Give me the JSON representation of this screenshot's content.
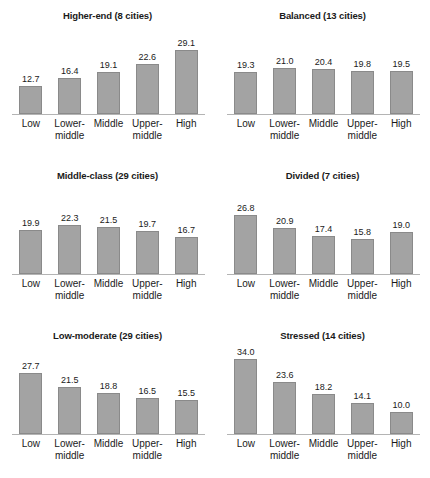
{
  "chart_data": {
    "type": "bar",
    "title": "",
    "xlabel": "",
    "ylabel": "",
    "ylim": [
      0,
      36
    ],
    "grid": false,
    "legend": "none",
    "categories": [
      "Low",
      "Lower-middle",
      "Middle",
      "Upper-middle",
      "High"
    ],
    "category_lines": [
      [
        "Low",
        ""
      ],
      [
        "Lower-",
        "middle"
      ],
      [
        "Middle",
        ""
      ],
      [
        "Upper-",
        "middle"
      ],
      [
        "High",
        ""
      ]
    ],
    "panels": [
      {
        "title": "Higher-end (8 cities)",
        "name": "Higher-end",
        "cities": 8,
        "values": [
          12.7,
          16.4,
          19.1,
          22.6,
          29.1
        ],
        "labels": [
          "12.7",
          "16.4",
          "19.1",
          "22.6",
          "29.1"
        ]
      },
      {
        "title": "Balanced (13 cities)",
        "name": "Balanced",
        "cities": 13,
        "values": [
          19.3,
          21.0,
          20.4,
          19.8,
          19.5
        ],
        "labels": [
          "19.3",
          "21.0",
          "20.4",
          "19.8",
          "19.5"
        ]
      },
      {
        "title": "Middle-class (29 cities)",
        "name": "Middle-class",
        "cities": 29,
        "values": [
          19.9,
          22.3,
          21.5,
          19.7,
          16.7
        ],
        "labels": [
          "19.9",
          "22.3",
          "21.5",
          "19.7",
          "16.7"
        ]
      },
      {
        "title": "Divided (7 cities)",
        "name": "Divided",
        "cities": 7,
        "values": [
          26.8,
          20.9,
          17.4,
          15.8,
          19.0
        ],
        "labels": [
          "26.8",
          "20.9",
          "17.4",
          "15.8",
          "19.0"
        ]
      },
      {
        "title": "Low-moderate (29 cities)",
        "name": "Low-moderate",
        "cities": 29,
        "values": [
          27.7,
          21.5,
          18.8,
          16.5,
          15.5
        ],
        "labels": [
          "27.7",
          "21.5",
          "18.8",
          "16.5",
          "15.5"
        ]
      },
      {
        "title": "Stressed (14 cities)",
        "name": "Stressed",
        "cities": 14,
        "values": [
          34.0,
          23.6,
          18.2,
          14.1,
          10.0
        ],
        "labels": [
          "34.0",
          "23.6",
          "18.2",
          "14.1",
          "10.0"
        ]
      }
    ],
    "colors": {
      "bar_fill": "#a3a3a3",
      "bar_stroke": "#8a8a8a",
      "baseline": "#b4b4b4",
      "text": "#1a1a1a",
      "background": "#ffffff"
    }
  }
}
